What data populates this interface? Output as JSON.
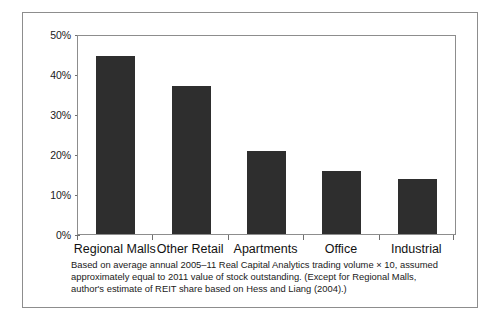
{
  "figure": {
    "caption": "Based on average annual 2005–11 Real Capital Analytics trading volume × 10, assumed approximately equal to 2011 value of stock outstanding. (Except for Regional Malls, author's estimate of REIT share based on Hess and Liang (2004).)"
  },
  "chart_data": {
    "type": "bar",
    "title": "",
    "xlabel": "",
    "ylabel": "",
    "categories": [
      "Regional Malls",
      "Other Retail",
      "Apartments",
      "Office",
      "Industrial"
    ],
    "values": [
      45,
      37.5,
      21,
      16,
      14
    ],
    "ylim": [
      0,
      50
    ],
    "ytick_values": [
      0,
      10,
      20,
      30,
      40,
      50
    ],
    "ytick_labels": [
      "0%",
      "10%",
      "20%",
      "30%",
      "40%",
      "50%"
    ],
    "grid": false,
    "legend": false,
    "bar_color": "#2e2e2e",
    "axis_color": "#8d8d8d",
    "value_unit": "percent"
  }
}
